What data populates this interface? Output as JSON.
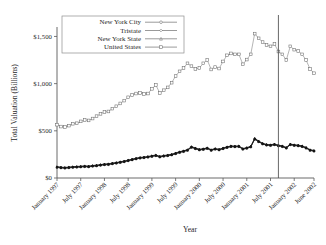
{
  "chart_data": {
    "type": "line",
    "title": "",
    "xlabel": "Year",
    "ylabel": "Total Valuation (Billions)",
    "ylim": [
      0,
      1600
    ],
    "ytick_values": [
      0,
      500,
      1000,
      1500
    ],
    "ytick_labels": [
      "$0",
      "$500",
      "$1,000",
      "$1,500"
    ],
    "grid": false,
    "legend_position": "top-left",
    "xtick_labels": [
      "January 1997",
      "July 1997",
      "January 1998",
      "July 1998",
      "January 1999",
      "July 1999",
      "January 2000",
      "July 2000",
      "January 2001",
      "July 2001",
      "January 2002",
      "June 2002"
    ],
    "xtick_index": [
      0,
      6,
      12,
      18,
      24,
      30,
      36,
      42,
      48,
      54,
      60,
      65
    ],
    "x_count": 66,
    "annotations": [
      {
        "name": "event-line",
        "label": "",
        "x_index": 56
      }
    ],
    "series": [
      {
        "name": "United States",
        "marker": "square-open",
        "style": "light",
        "values": [
          565,
          545,
          540,
          555,
          575,
          580,
          600,
          615,
          610,
          630,
          655,
          680,
          700,
          705,
          735,
          760,
          790,
          820,
          855,
          880,
          895,
          900,
          890,
          895,
          945,
          985,
          900,
          930,
          960,
          1010,
          1080,
          1130,
          1165,
          1215,
          1185,
          1155,
          1165,
          1215,
          1250,
          1150,
          1175,
          1160,
          1235,
          1300,
          1320,
          1310,
          1310,
          1205,
          1255,
          1310,
          1530,
          1480,
          1440,
          1410,
          1395,
          1420,
          1340,
          1310,
          1250,
          1395,
          1360,
          1345,
          1310,
          1250,
          1155,
          1110,
          1075,
          1095,
          1105,
          1085,
          1120,
          1065,
          1035,
          1055,
          1010,
          960,
          930,
          885
        ]
      },
      {
        "name": "Tristate",
        "marker": "diamond-open",
        "style": "dark",
        "values": [
          120,
          115,
          112,
          116,
          120,
          122,
          125,
          128,
          126,
          132,
          136,
          142,
          148,
          150,
          158,
          164,
          172,
          180,
          190,
          200,
          210,
          218,
          222,
          228,
          236,
          244,
          230,
          238,
          244,
          252,
          265,
          278,
          288,
          300,
          332,
          318,
          305,
          310,
          320,
          300,
          312,
          305,
          318,
          330,
          340,
          338,
          340,
          312,
          322,
          336,
          420,
          392,
          368,
          356,
          352,
          360,
          348,
          340,
          324,
          360,
          352,
          348,
          340,
          324,
          300,
          292,
          284,
          288,
          290,
          286,
          292,
          282,
          276,
          280,
          272,
          262,
          256,
          248
        ]
      },
      {
        "name": "New York State",
        "marker": "triangle-open",
        "style": "dark",
        "values": [
          116,
          111,
          108,
          112,
          116,
          118,
          121,
          124,
          122,
          128,
          132,
          138,
          144,
          146,
          154,
          160,
          168,
          176,
          186,
          196,
          206,
          214,
          218,
          224,
          232,
          240,
          226,
          234,
          240,
          248,
          261,
          274,
          284,
          296,
          328,
          314,
          301,
          306,
          316,
          296,
          308,
          301,
          314,
          326,
          336,
          334,
          336,
          308,
          318,
          332,
          414,
          388,
          364,
          352,
          348,
          356,
          344,
          336,
          320,
          356,
          348,
          344,
          336,
          320,
          296,
          288,
          280,
          284,
          286,
          282,
          288,
          278,
          272,
          276,
          268,
          258,
          252,
          244
        ]
      },
      {
        "name": "New York City",
        "marker": "circle-open",
        "style": "dark",
        "values": [
          112,
          107,
          104,
          108,
          112,
          114,
          117,
          120,
          118,
          124,
          128,
          134,
          140,
          142,
          150,
          156,
          164,
          172,
          182,
          192,
          202,
          210,
          214,
          220,
          228,
          236,
          222,
          230,
          236,
          244,
          257,
          270,
          280,
          292,
          324,
          310,
          297,
          302,
          312,
          292,
          304,
          297,
          310,
          322,
          332,
          330,
          332,
          304,
          314,
          328,
          410,
          384,
          360,
          348,
          344,
          352,
          340,
          332,
          316,
          352,
          344,
          340,
          332,
          316,
          292,
          284,
          276,
          280,
          282,
          278,
          284,
          274,
          268,
          272,
          264,
          254,
          248,
          240
        ]
      }
    ],
    "legend_entries": [
      {
        "label": "New York City",
        "marker": "circle-open"
      },
      {
        "label": "Tristate",
        "marker": "diamond-open"
      },
      {
        "label": "New York State",
        "marker": "triangle-open"
      },
      {
        "label": "United States",
        "marker": "square-open"
      }
    ]
  }
}
